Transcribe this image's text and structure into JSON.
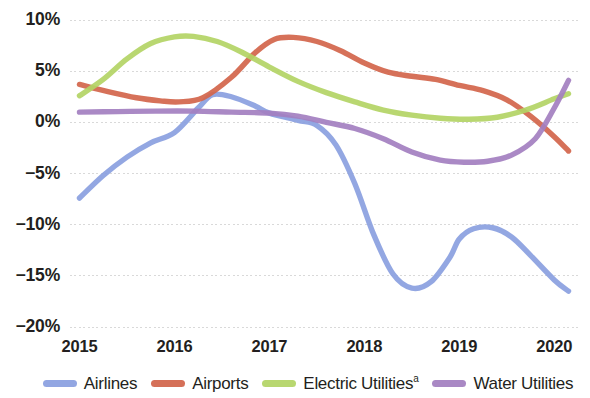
{
  "chart_data": {
    "type": "line",
    "title": "",
    "subtitle": "",
    "xlabel": "",
    "ylabel": "",
    "grid": true,
    "legend_position": "bottom",
    "x": [
      2015,
      2016,
      2017,
      2018,
      2019,
      2020
    ],
    "xtick_labels": [
      "2015",
      "2016",
      "2017",
      "2018",
      "2019",
      "2020"
    ],
    "xlim": [
      2014.9,
      2020.25
    ],
    "ylim": [
      -20,
      10
    ],
    "ytick_labels": [
      "10%",
      "5%",
      "0%",
      "−5%",
      "−10%",
      "−15%",
      "−20%"
    ],
    "ytick_values": [
      10,
      5,
      0,
      -5,
      -10,
      -15,
      -20
    ],
    "series": [
      {
        "name": "Airlines",
        "color": "#8a9fe0",
        "values": [
          -7.4,
          -1.2,
          2.6,
          -1.8,
          -16.2,
          -16.5
        ],
        "points": [
          [
            2015.0,
            -7.4
          ],
          [
            2015.25,
            -5.2
          ],
          [
            2015.5,
            -3.4
          ],
          [
            2015.75,
            -2.0
          ],
          [
            2016.0,
            -1.0
          ],
          [
            2016.25,
            1.4
          ],
          [
            2016.4,
            2.7
          ],
          [
            2016.6,
            2.5
          ],
          [
            2016.85,
            1.6
          ],
          [
            2017.0,
            0.9
          ],
          [
            2017.3,
            0.2
          ],
          [
            2017.5,
            -0.3
          ],
          [
            2017.7,
            -2.2
          ],
          [
            2017.9,
            -6.0
          ],
          [
            2018.1,
            -11.0
          ],
          [
            2018.3,
            -14.8
          ],
          [
            2018.5,
            -16.2
          ],
          [
            2018.7,
            -15.6
          ],
          [
            2018.9,
            -13.2
          ],
          [
            2019.0,
            -11.4
          ],
          [
            2019.15,
            -10.4
          ],
          [
            2019.35,
            -10.3
          ],
          [
            2019.55,
            -11.2
          ],
          [
            2019.75,
            -13.0
          ],
          [
            2020.0,
            -15.4
          ],
          [
            2020.15,
            -16.5
          ]
        ]
      },
      {
        "name": "Airports",
        "color": "#d2654b",
        "values": [
          3.7,
          2.1,
          8.3,
          5.0,
          3.1,
          -2.8
        ],
        "points": [
          [
            2015.0,
            3.7
          ],
          [
            2015.3,
            3.0
          ],
          [
            2015.6,
            2.4
          ],
          [
            2015.85,
            2.1
          ],
          [
            2016.05,
            2.0
          ],
          [
            2016.3,
            2.4
          ],
          [
            2016.6,
            4.4
          ],
          [
            2016.85,
            6.8
          ],
          [
            2017.05,
            8.1
          ],
          [
            2017.25,
            8.3
          ],
          [
            2017.5,
            7.9
          ],
          [
            2017.75,
            7.0
          ],
          [
            2018.0,
            5.8
          ],
          [
            2018.25,
            4.9
          ],
          [
            2018.5,
            4.5
          ],
          [
            2018.75,
            4.2
          ],
          [
            2019.0,
            3.6
          ],
          [
            2019.25,
            3.1
          ],
          [
            2019.5,
            2.2
          ],
          [
            2019.75,
            0.6
          ],
          [
            2020.0,
            -1.4
          ],
          [
            2020.15,
            -2.8
          ]
        ]
      },
      {
        "name": "Electric Utilities",
        "footnote": "a",
        "color": "#b3d465",
        "values": [
          2.6,
          8.3,
          5.4,
          1.5,
          0.3,
          2.8
        ],
        "points": [
          [
            2015.0,
            2.6
          ],
          [
            2015.25,
            4.2
          ],
          [
            2015.5,
            6.2
          ],
          [
            2015.75,
            7.7
          ],
          [
            2016.0,
            8.35
          ],
          [
            2016.2,
            8.4
          ],
          [
            2016.45,
            7.9
          ],
          [
            2016.7,
            6.9
          ],
          [
            2017.0,
            5.4
          ],
          [
            2017.3,
            4.0
          ],
          [
            2017.6,
            2.9
          ],
          [
            2017.9,
            2.0
          ],
          [
            2018.2,
            1.2
          ],
          [
            2018.5,
            0.7
          ],
          [
            2018.8,
            0.4
          ],
          [
            2019.1,
            0.3
          ],
          [
            2019.4,
            0.5
          ],
          [
            2019.7,
            1.2
          ],
          [
            2020.0,
            2.3
          ],
          [
            2020.15,
            2.8
          ]
        ]
      },
      {
        "name": "Water Utilities",
        "color": "#a37fc0",
        "values": [
          1.0,
          1.1,
          0.9,
          -0.4,
          -3.9,
          4.1
        ],
        "points": [
          [
            2015.0,
            1.0
          ],
          [
            2015.4,
            1.05
          ],
          [
            2015.8,
            1.1
          ],
          [
            2016.2,
            1.1
          ],
          [
            2016.6,
            1.0
          ],
          [
            2017.0,
            0.9
          ],
          [
            2017.3,
            0.6
          ],
          [
            2017.6,
            0.0
          ],
          [
            2017.9,
            -0.6
          ],
          [
            2018.2,
            -1.6
          ],
          [
            2018.5,
            -2.9
          ],
          [
            2018.8,
            -3.7
          ],
          [
            2019.05,
            -3.9
          ],
          [
            2019.3,
            -3.8
          ],
          [
            2019.55,
            -3.2
          ],
          [
            2019.8,
            -1.6
          ],
          [
            2020.0,
            1.4
          ],
          [
            2020.15,
            4.1
          ]
        ]
      }
    ]
  },
  "legend": {
    "items": [
      {
        "label": "Airlines",
        "sup": "",
        "color": "#8a9fe0"
      },
      {
        "label": "Airports",
        "sup": "",
        "color": "#d2654b"
      },
      {
        "label": "Electric Utilities",
        "sup": "a",
        "color": "#b3d465"
      },
      {
        "label": "Water Utilities",
        "sup": "",
        "color": "#a37fc0"
      }
    ]
  }
}
